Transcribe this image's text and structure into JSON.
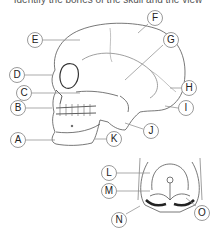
{
  "caption": "Identify the bones of the skull and the view",
  "diagram": {
    "labels": [
      {
        "id": "A",
        "x": 18,
        "y": 140,
        "lx": [
          26,
          55
        ],
        "ly": [
          140,
          140
        ]
      },
      {
        "id": "B",
        "x": 18,
        "y": 108,
        "lx": [
          26,
          52
        ],
        "ly": [
          108,
          108
        ]
      },
      {
        "id": "C",
        "x": 24,
        "y": 93,
        "lx": [
          32,
          80
        ],
        "ly": [
          93,
          93
        ]
      },
      {
        "id": "D",
        "x": 17,
        "y": 75,
        "lx": [
          25,
          52
        ],
        "ly": [
          75,
          75
        ]
      },
      {
        "id": "E",
        "x": 35,
        "y": 40,
        "lx": [
          43,
          80
        ],
        "ly": [
          40,
          40
        ]
      },
      {
        "id": "F",
        "x": 155,
        "y": 18,
        "lx": [
          148,
          138
        ],
        "ly": [
          24,
          33
        ]
      },
      {
        "id": "G",
        "x": 171,
        "y": 40,
        "lx": [
          163,
          125
        ],
        "ly": [
          45,
          80
        ]
      },
      {
        "id": "H",
        "x": 189,
        "y": 88,
        "lx": [
          181,
          170
        ],
        "ly": [
          88,
          88
        ]
      },
      {
        "id": "I",
        "x": 186,
        "y": 108,
        "lx": [
          178,
          165
        ],
        "ly": [
          108,
          106
        ]
      },
      {
        "id": "J",
        "x": 151,
        "y": 131,
        "lx": [
          143,
          125
        ],
        "ly": [
          129,
          123
        ]
      },
      {
        "id": "K",
        "x": 114,
        "y": 139,
        "lx": [
          106,
          95
        ],
        "ly": [
          139,
          139
        ]
      },
      {
        "id": "L",
        "x": 109,
        "y": 173,
        "lx": [
          117,
          150
        ],
        "ly": [
          173,
          173
        ]
      },
      {
        "id": "M",
        "x": 109,
        "y": 191,
        "lx": [
          117,
          150
        ],
        "ly": [
          191,
          191
        ]
      },
      {
        "id": "N",
        "x": 119,
        "y": 220,
        "lx": [
          126,
          140
        ],
        "ly": [
          214,
          206
        ]
      },
      {
        "id": "O",
        "x": 202,
        "y": 213,
        "lx": [
          196,
          186
        ],
        "ly": [
          206,
          198
        ]
      }
    ]
  }
}
